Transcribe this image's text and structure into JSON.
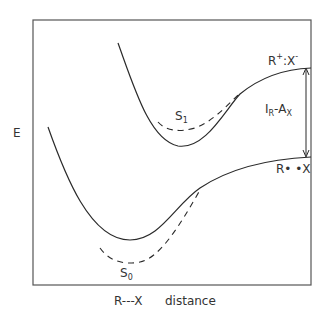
{
  "diagram": {
    "y_axis_label": "E",
    "x_axis_label_left": "R---X",
    "x_axis_label_right": "distance",
    "upper_state": {
      "label": "R",
      "charge": "+",
      "sep": ":X",
      "anion_charge": "-"
    },
    "lower_state": {
      "label": "R• •X"
    },
    "gap_label": {
      "I": "I",
      "I_sub": "R",
      "dash": "-A",
      "A_sub": "X"
    },
    "s1": {
      "label": "S",
      "sub": "1"
    },
    "s0": {
      "label": "S",
      "sub": "0"
    },
    "colors": {
      "line": "#2a2a2a",
      "frame": "#555555",
      "background": "#ffffff"
    }
  }
}
